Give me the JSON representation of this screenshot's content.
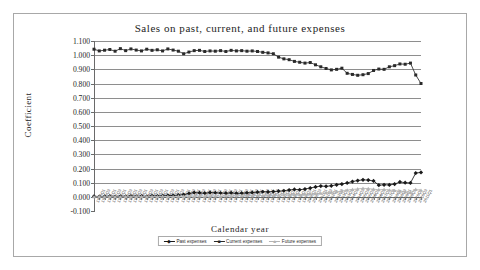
{
  "chart_data": {
    "type": "line",
    "title": "Sales on past, current, and future expenses",
    "xlabel": "Calendar year",
    "ylabel": "Coefficient",
    "ylim": [
      -0.1,
      1.1
    ],
    "ytick_labels": [
      "1.100",
      "1.000",
      "0.900",
      "0.800",
      "0.700",
      "0.600",
      "0.500",
      "0.400",
      "0.300",
      "0.200",
      "0.100",
      "0.000",
      "-0.100"
    ],
    "ytick_values": [
      1.1,
      1.0,
      0.9,
      0.8,
      0.7,
      0.6,
      0.5,
      0.4,
      0.3,
      0.2,
      0.1,
      0.0,
      -0.1
    ],
    "grid": "horizontal",
    "legend_position": "bottom-center",
    "categories": [
      "1980Q1",
      "1980Q3",
      "1981Q1",
      "1981Q3",
      "1982Q1",
      "1982Q3",
      "1983Q1",
      "1983Q3",
      "1984Q1",
      "1984Q3",
      "1985Q1",
      "1985Q3",
      "1986Q1",
      "1986Q3",
      "1987Q1",
      "1987Q3",
      "1988Q1",
      "1988Q3",
      "1989Q1",
      "1989Q3",
      "1990Q1",
      "1990Q3",
      "1991Q1",
      "1991Q3",
      "1992Q1",
      "1992Q3",
      "1993Q1",
      "1993Q3",
      "1994Q1",
      "1994Q3",
      "1995Q1",
      "1995Q3",
      "1996Q1",
      "1996Q3",
      "1997Q1",
      "1997Q3",
      "1998Q1",
      "1998Q3",
      "1999Q1",
      "1999Q3",
      "2000Q1",
      "2000Q3",
      "2001Q1",
      "2001Q3",
      "2002Q1",
      "2002Q3",
      "2003Q1",
      "2003Q3",
      "2004Q1",
      "2004Q3",
      "2005Q1",
      "2005Q3",
      "2006Q1",
      "2006Q3",
      "2007Q1",
      "2007Q3",
      "2008Q1",
      "2008Q3",
      "2009Q1",
      "2009Q3",
      "2010Q1",
      "2010Q3",
      "2011Q1"
    ],
    "series": [
      {
        "name": "Past expenses",
        "marker": "filled-diamond",
        "color": "#1a1a1a",
        "values": [
          0.004,
          0.002,
          0.003,
          0.005,
          0.002,
          0.004,
          0.003,
          0.006,
          0.004,
          0.005,
          0.003,
          0.007,
          0.006,
          0.008,
          0.01,
          0.009,
          0.012,
          0.016,
          0.024,
          0.03,
          0.028,
          0.026,
          0.03,
          0.029,
          0.027,
          0.026,
          0.028,
          0.025,
          0.026,
          0.028,
          0.03,
          0.033,
          0.036,
          0.035,
          0.037,
          0.04,
          0.043,
          0.048,
          0.052,
          0.05,
          0.055,
          0.062,
          0.07,
          0.076,
          0.074,
          0.078,
          0.085,
          0.09,
          0.098,
          0.108,
          0.115,
          0.12,
          0.118,
          0.112,
          0.082,
          0.085,
          0.084,
          0.09,
          0.105,
          0.1,
          0.098,
          0.168,
          0.172
        ]
      },
      {
        "name": "Current expenses",
        "marker": "filled-square",
        "color": "#2a2a2a",
        "values": [
          1.042,
          1.03,
          1.035,
          1.04,
          1.028,
          1.046,
          1.032,
          1.044,
          1.036,
          1.03,
          1.042,
          1.034,
          1.038,
          1.03,
          1.044,
          1.036,
          1.028,
          1.01,
          1.022,
          1.032,
          1.034,
          1.026,
          1.03,
          1.028,
          1.032,
          1.026,
          1.034,
          1.03,
          1.032,
          1.028,
          1.03,
          1.026,
          1.02,
          1.016,
          1.01,
          0.986,
          0.974,
          0.968,
          0.956,
          0.95,
          0.944,
          0.948,
          0.932,
          0.918,
          0.906,
          0.896,
          0.9,
          0.908,
          0.872,
          0.864,
          0.858,
          0.862,
          0.87,
          0.892,
          0.902,
          0.9,
          0.918,
          0.926,
          0.938,
          0.936,
          0.944,
          0.86,
          0.8
        ]
      },
      {
        "name": "Future expenses",
        "marker": "filled-triangle",
        "color": "#b4b4b4",
        "values": [
          0.0,
          0.001,
          0.0,
          0.002,
          0.001,
          0.0,
          0.002,
          0.001,
          0.003,
          0.002,
          0.001,
          0.003,
          0.002,
          0.004,
          0.003,
          0.002,
          0.004,
          0.003,
          0.005,
          0.004,
          0.006,
          0.005,
          0.004,
          0.006,
          0.005,
          0.007,
          0.006,
          0.008,
          0.007,
          0.009,
          0.008,
          0.01,
          0.009,
          0.011,
          0.01,
          0.012,
          0.014,
          0.013,
          0.016,
          0.015,
          0.018,
          0.02,
          0.022,
          0.025,
          0.028,
          0.032,
          0.036,
          0.04,
          0.048,
          0.052,
          0.056,
          0.06,
          0.058,
          0.054,
          0.05,
          0.052,
          0.048,
          0.044,
          0.04,
          0.036,
          0.03,
          0.052,
          0.046
        ]
      }
    ]
  }
}
